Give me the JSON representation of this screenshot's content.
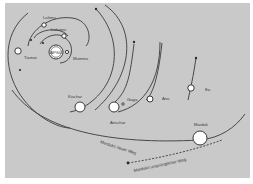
{
  "diagram": {
    "title": "",
    "background_color": "#c9c9c9",
    "line_color": "#3a3a3a",
    "center": {
      "label": "APSU"
    },
    "bodies": [
      {
        "id": "lahmu",
        "label": "Lahmu"
      },
      {
        "id": "lahamu",
        "label": "Lahamu"
      },
      {
        "id": "mummu",
        "label": "Mummu"
      },
      {
        "id": "tiamat",
        "label": "Tiamat"
      },
      {
        "id": "kischar",
        "label": "Kischar"
      },
      {
        "id": "anschar",
        "label": "Anschar"
      },
      {
        "id": "gaga",
        "label": "Gaga"
      },
      {
        "id": "anu",
        "label": "Anu"
      },
      {
        "id": "ea",
        "label": "Ea"
      },
      {
        "id": "marduk",
        "label": "Marduk"
      }
    ],
    "paths": [
      {
        "id": "marduk-new",
        "label": "Marduks neuer Weg"
      },
      {
        "id": "marduk-original",
        "label": "Marduks ursprünglicher Weg"
      }
    ]
  }
}
